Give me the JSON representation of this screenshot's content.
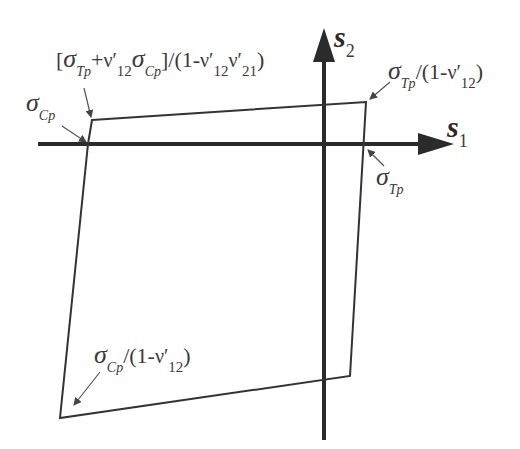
{
  "diagram": {
    "axes": {
      "horizontal": {
        "name": "s",
        "subscript": "1"
      },
      "vertical": {
        "name": "s",
        "subscript": "2"
      }
    },
    "labels": {
      "top_left_corner": {
        "open_bracket": "[",
        "sigma": "σ",
        "sigma_sub": "Tp",
        "plus": "+",
        "nu": "ν′",
        "nu_sub": "12",
        "sigma2": "σ",
        "sigma2_sub": "Cp",
        "close": "]/(1-",
        "nu2": "ν′",
        "nu2_sub": "12",
        "nu3": "ν′",
        "nu3_sub": "21",
        "end": ")"
      },
      "top_right_corner": {
        "sigma": "σ",
        "sigma_sub": "Tp",
        "rest": "/(1-",
        "nu": "ν′",
        "nu_sub": "12",
        "end": ")"
      },
      "compressive_intercept": {
        "sigma": "σ",
        "sigma_sub": "Cp"
      },
      "tensile_intercept": {
        "sigma": "σ",
        "sigma_sub": "Tp"
      },
      "bottom_left_corner": {
        "sigma": "σ",
        "sigma_sub": "Cp",
        "rest": "/(1-",
        "nu": "ν′",
        "nu_sub": "12",
        "end": ")"
      }
    },
    "colors": {
      "axis": "#2b2b2b",
      "envelope": "#333333",
      "pointer": "#555555",
      "text": "#3a3a3a"
    }
  }
}
